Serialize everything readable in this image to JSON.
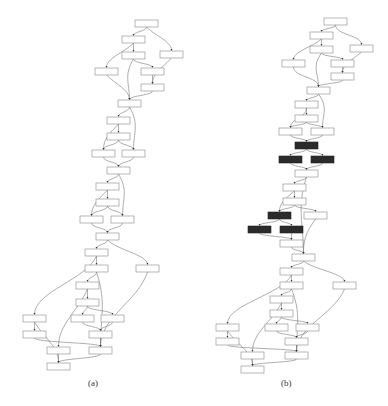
{
  "figure": {
    "panels": [
      {
        "id": "a",
        "caption": "(a)",
        "caption_pos": [
          88,
          378
        ],
        "node_fill": "#ffffff",
        "highlight_fill": "#2b2b2b",
        "nodes": [
          {
            "id": "n0",
            "x": 135,
            "y": 20,
            "hl": false
          },
          {
            "id": "n1",
            "x": 122,
            "y": 36,
            "hl": false
          },
          {
            "id": "n2",
            "x": 122,
            "y": 52,
            "hl": false
          },
          {
            "id": "n3",
            "x": 160,
            "y": 51,
            "hl": false
          },
          {
            "id": "n4",
            "x": 95,
            "y": 68,
            "hl": false
          },
          {
            "id": "n5",
            "x": 141,
            "y": 68,
            "hl": false
          },
          {
            "id": "n6",
            "x": 141,
            "y": 84,
            "hl": false
          },
          {
            "id": "n7",
            "x": 118,
            "y": 100,
            "hl": false
          },
          {
            "id": "n8",
            "x": 107,
            "y": 117,
            "hl": false
          },
          {
            "id": "n9",
            "x": 107,
            "y": 133,
            "hl": false
          },
          {
            "id": "n10",
            "x": 92,
            "y": 150,
            "hl": false
          },
          {
            "id": "n11",
            "x": 122,
            "y": 150,
            "hl": false
          },
          {
            "id": "n12",
            "x": 107,
            "y": 167,
            "hl": false
          },
          {
            "id": "n13",
            "x": 96,
            "y": 183,
            "hl": false
          },
          {
            "id": "n14",
            "x": 96,
            "y": 199,
            "hl": false
          },
          {
            "id": "n15",
            "x": 80,
            "y": 216,
            "hl": false
          },
          {
            "id": "n16",
            "x": 111,
            "y": 216,
            "hl": false
          },
          {
            "id": "n17",
            "x": 96,
            "y": 233,
            "hl": false
          },
          {
            "id": "n18",
            "x": 85,
            "y": 249,
            "hl": false
          },
          {
            "id": "n19",
            "x": 85,
            "y": 265,
            "hl": false
          },
          {
            "id": "n20",
            "x": 136,
            "y": 265,
            "hl": false
          },
          {
            "id": "n21",
            "x": 76,
            "y": 282,
            "hl": false
          },
          {
            "id": "n22",
            "x": 76,
            "y": 299,
            "hl": false
          },
          {
            "id": "n23",
            "x": 23,
            "y": 315,
            "hl": false
          },
          {
            "id": "n24",
            "x": 71,
            "y": 315,
            "hl": false
          },
          {
            "id": "n25",
            "x": 101,
            "y": 315,
            "hl": false
          },
          {
            "id": "n26",
            "x": 23,
            "y": 331,
            "hl": false
          },
          {
            "id": "n27",
            "x": 89,
            "y": 331,
            "hl": false
          },
          {
            "id": "n28",
            "x": 47,
            "y": 347,
            "hl": false
          },
          {
            "id": "n29",
            "x": 89,
            "y": 347,
            "hl": false
          },
          {
            "id": "n30",
            "x": 47,
            "y": 363,
            "hl": false
          }
        ],
        "edges": [
          [
            "n0",
            "n1"
          ],
          [
            "n0",
            "n3"
          ],
          [
            "n1",
            "n2"
          ],
          [
            "n1",
            "n4"
          ],
          [
            "n2",
            "n5"
          ],
          [
            "n2",
            "n7"
          ],
          [
            "n3",
            "n6"
          ],
          [
            "n5",
            "n6"
          ],
          [
            "n4",
            "n7"
          ],
          [
            "n6",
            "n7"
          ],
          [
            "n7",
            "n8"
          ],
          [
            "n7",
            "n11"
          ],
          [
            "n8",
            "n9"
          ],
          [
            "n8",
            "n10"
          ],
          [
            "n9",
            "n10"
          ],
          [
            "n9",
            "n11"
          ],
          [
            "n10",
            "n12"
          ],
          [
            "n11",
            "n12"
          ],
          [
            "n12",
            "n13"
          ],
          [
            "n12",
            "n16"
          ],
          [
            "n13",
            "n14"
          ],
          [
            "n13",
            "n15"
          ],
          [
            "n14",
            "n15"
          ],
          [
            "n14",
            "n16"
          ],
          [
            "n15",
            "n17"
          ],
          [
            "n16",
            "n17"
          ],
          [
            "n17",
            "n18"
          ],
          [
            "n17",
            "n20"
          ],
          [
            "n18",
            "n19"
          ],
          [
            "n18",
            "n23"
          ],
          [
            "n19",
            "n21"
          ],
          [
            "n19",
            "n29"
          ],
          [
            "n20",
            "n29"
          ],
          [
            "n21",
            "n22"
          ],
          [
            "n21",
            "n28"
          ],
          [
            "n22",
            "n24"
          ],
          [
            "n22",
            "n25"
          ],
          [
            "n24",
            "n27"
          ],
          [
            "n25",
            "n27"
          ],
          [
            "n27",
            "n29"
          ],
          [
            "n23",
            "n26"
          ],
          [
            "n23",
            "n30"
          ],
          [
            "n26",
            "n29"
          ],
          [
            "n28",
            "n30"
          ],
          [
            "n29",
            "n30"
          ]
        ]
      },
      {
        "id": "b",
        "caption": "(b)",
        "caption_pos": [
          281,
          378
        ],
        "node_fill": "#ffffff",
        "highlight_fill": "#2b2b2b",
        "nodes": [
          {
            "id": "m0",
            "x": 324,
            "y": 18,
            "hl": false
          },
          {
            "id": "m1",
            "x": 310,
            "y": 32,
            "hl": false
          },
          {
            "id": "m2",
            "x": 310,
            "y": 46,
            "hl": false
          },
          {
            "id": "m3",
            "x": 350,
            "y": 45,
            "hl": false
          },
          {
            "id": "m4",
            "x": 282,
            "y": 60,
            "hl": false
          },
          {
            "id": "m5",
            "x": 331,
            "y": 60,
            "hl": false
          },
          {
            "id": "m6",
            "x": 331,
            "y": 73,
            "hl": false
          },
          {
            "id": "m7",
            "x": 307,
            "y": 87,
            "hl": false
          },
          {
            "id": "m8",
            "x": 295,
            "y": 101,
            "hl": false
          },
          {
            "id": "m9",
            "x": 295,
            "y": 115,
            "hl": false
          },
          {
            "id": "m10",
            "x": 279,
            "y": 128,
            "hl": false
          },
          {
            "id": "m11",
            "x": 311,
            "y": 128,
            "hl": false
          },
          {
            "id": "m12",
            "x": 295,
            "y": 142,
            "hl": true
          },
          {
            "id": "m13",
            "x": 279,
            "y": 156,
            "hl": true
          },
          {
            "id": "m14",
            "x": 311,
            "y": 156,
            "hl": true
          },
          {
            "id": "m15",
            "x": 295,
            "y": 170,
            "hl": false
          },
          {
            "id": "m16",
            "x": 283,
            "y": 184,
            "hl": false
          },
          {
            "id": "m17",
            "x": 283,
            "y": 198,
            "hl": false
          },
          {
            "id": "m18",
            "x": 268,
            "y": 212,
            "hl": true
          },
          {
            "id": "m19",
            "x": 304,
            "y": 212,
            "hl": false
          },
          {
            "id": "m20",
            "x": 248,
            "y": 226,
            "hl": true
          },
          {
            "id": "m21",
            "x": 280,
            "y": 226,
            "hl": true
          },
          {
            "id": "m22",
            "x": 280,
            "y": 240,
            "hl": false
          },
          {
            "id": "m23",
            "x": 292,
            "y": 254,
            "hl": false
          },
          {
            "id": "m24",
            "x": 280,
            "y": 268,
            "hl": false
          },
          {
            "id": "m25",
            "x": 280,
            "y": 282,
            "hl": false
          },
          {
            "id": "m26",
            "x": 333,
            "y": 282,
            "hl": false
          },
          {
            "id": "m27",
            "x": 270,
            "y": 296,
            "hl": false
          },
          {
            "id": "m28",
            "x": 270,
            "y": 310,
            "hl": false
          },
          {
            "id": "m29",
            "x": 216,
            "y": 324,
            "hl": false
          },
          {
            "id": "m30",
            "x": 265,
            "y": 324,
            "hl": false
          },
          {
            "id": "m31",
            "x": 296,
            "y": 324,
            "hl": false
          },
          {
            "id": "m32",
            "x": 216,
            "y": 338,
            "hl": false
          },
          {
            "id": "m33",
            "x": 285,
            "y": 338,
            "hl": false
          },
          {
            "id": "m34",
            "x": 241,
            "y": 352,
            "hl": false
          },
          {
            "id": "m35",
            "x": 285,
            "y": 352,
            "hl": false
          },
          {
            "id": "m36",
            "x": 241,
            "y": 366,
            "hl": false
          }
        ],
        "edges": [
          [
            "m0",
            "m1"
          ],
          [
            "m0",
            "m3"
          ],
          [
            "m1",
            "m2"
          ],
          [
            "m1",
            "m4"
          ],
          [
            "m2",
            "m5"
          ],
          [
            "m2",
            "m7"
          ],
          [
            "m3",
            "m6"
          ],
          [
            "m5",
            "m6"
          ],
          [
            "m4",
            "m7"
          ],
          [
            "m6",
            "m7"
          ],
          [
            "m7",
            "m8"
          ],
          [
            "m7",
            "m11"
          ],
          [
            "m8",
            "m9"
          ],
          [
            "m8",
            "m10"
          ],
          [
            "m9",
            "m10"
          ],
          [
            "m9",
            "m11"
          ],
          [
            "m10",
            "m12"
          ],
          [
            "m11",
            "m12"
          ],
          [
            "m12",
            "m13"
          ],
          [
            "m12",
            "m14"
          ],
          [
            "m13",
            "m15"
          ],
          [
            "m14",
            "m15"
          ],
          [
            "m15",
            "m16"
          ],
          [
            "m15",
            "m23"
          ],
          [
            "m16",
            "m17"
          ],
          [
            "m16",
            "m18"
          ],
          [
            "m17",
            "m18"
          ],
          [
            "m17",
            "m19"
          ],
          [
            "m18",
            "m20"
          ],
          [
            "m18",
            "m21"
          ],
          [
            "m20",
            "m22"
          ],
          [
            "m21",
            "m22"
          ],
          [
            "m22",
            "m23"
          ],
          [
            "m19",
            "m23"
          ],
          [
            "m23",
            "m24"
          ],
          [
            "m23",
            "m26"
          ],
          [
            "m24",
            "m25"
          ],
          [
            "m24",
            "m29"
          ],
          [
            "m25",
            "m27"
          ],
          [
            "m25",
            "m35"
          ],
          [
            "m26",
            "m35"
          ],
          [
            "m27",
            "m28"
          ],
          [
            "m27",
            "m34"
          ],
          [
            "m28",
            "m30"
          ],
          [
            "m28",
            "m31"
          ],
          [
            "m30",
            "m33"
          ],
          [
            "m31",
            "m33"
          ],
          [
            "m33",
            "m35"
          ],
          [
            "m29",
            "m32"
          ],
          [
            "m29",
            "m36"
          ],
          [
            "m32",
            "m35"
          ],
          [
            "m34",
            "m36"
          ],
          [
            "m35",
            "m36"
          ]
        ]
      }
    ],
    "node_size": {
      "w": 23,
      "h": 7
    },
    "stroke": "#888888",
    "edge_color": "#777777",
    "arrow_color": "#333333"
  }
}
